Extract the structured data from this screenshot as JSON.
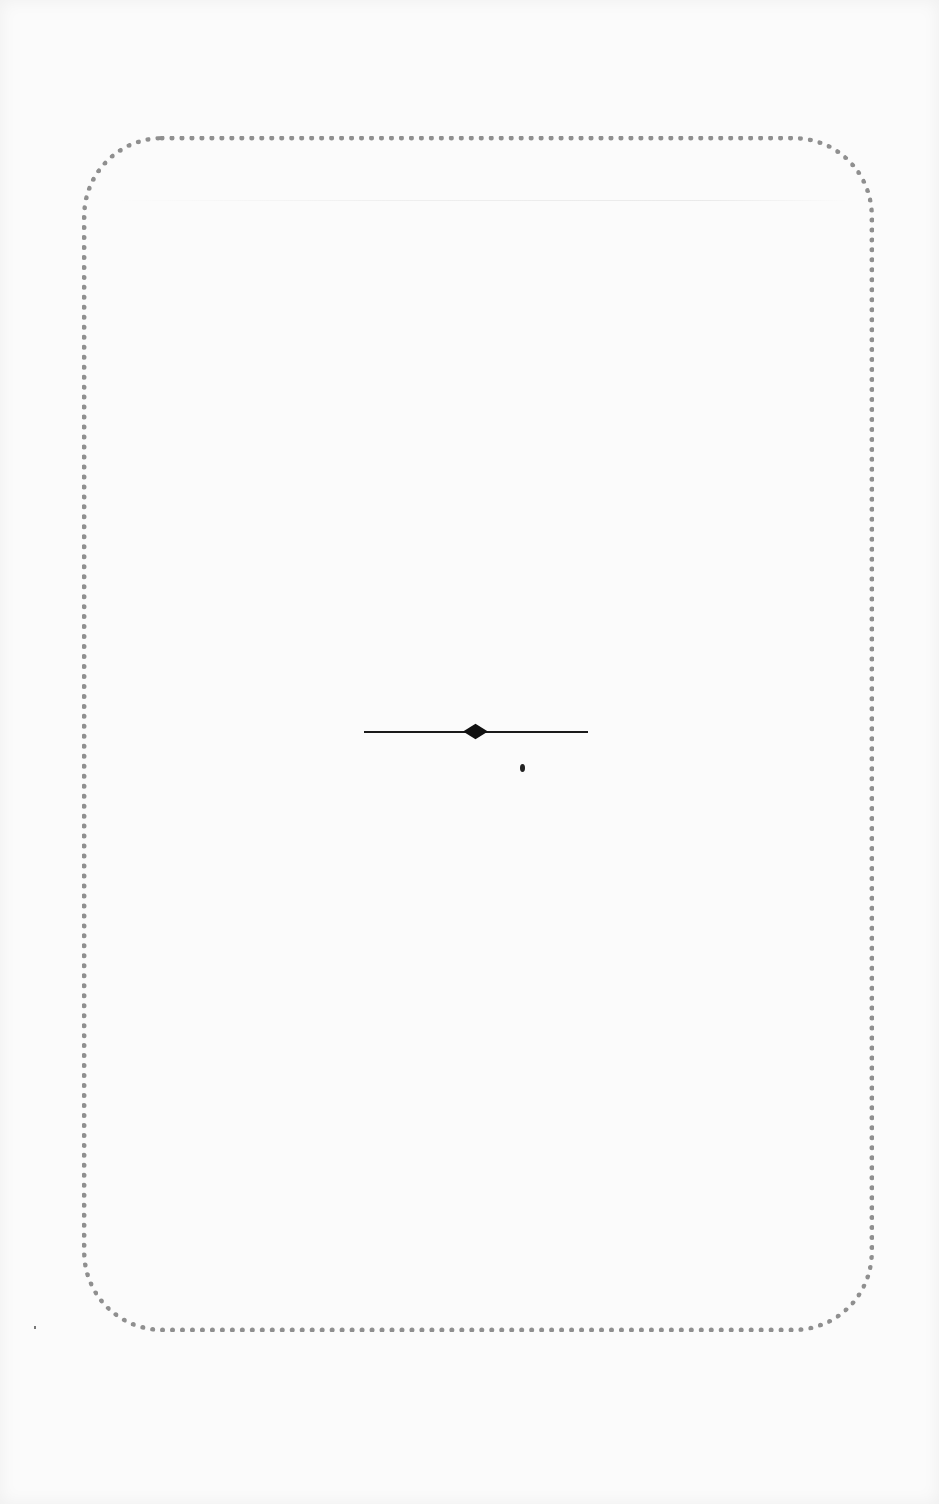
{
  "page": {
    "background_color": "#fbfbfb",
    "frame": {
      "style": "dotted-rounded-border",
      "color": "#8f8f8f"
    },
    "ornament": {
      "type": "horizontal-rule-with-center-diamond",
      "color": "#1a1a1a"
    },
    "text": []
  }
}
